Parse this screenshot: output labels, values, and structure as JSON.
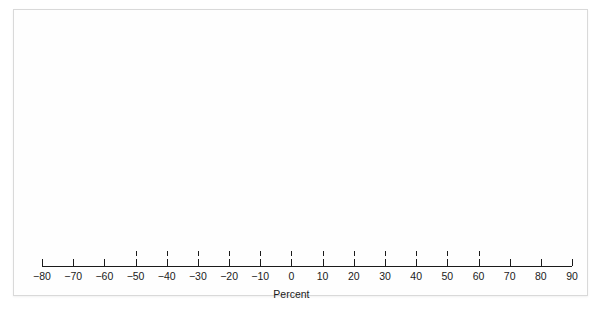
{
  "chart_data": {
    "type": "table",
    "title": "",
    "subtitle": "",
    "xlabel": "Percent",
    "ylabel": "",
    "xlim": [
      -85,
      95
    ],
    "xticks": [
      -80,
      -70,
      -60,
      -50,
      -40,
      -30,
      -20,
      -10,
      0,
      10,
      20,
      30,
      40,
      50,
      60,
      70,
      80,
      90
    ],
    "xticklabels": [
      "−80",
      "−70",
      "−60",
      "−50",
      "−40",
      "−30",
      "−20",
      "−10",
      "0",
      "10",
      "20",
      "30",
      "40",
      "50",
      "60",
      "70",
      "80",
      "90"
    ],
    "grid": false,
    "legend": null,
    "bin_width": 10,
    "bins": [
      {
        "bin_center": -45,
        "bin_range": [
          -50,
          -40
        ],
        "count": 1,
        "labels": [
          "1931"
        ]
      },
      {
        "bin_center": -35,
        "bin_range": [
          -40,
          -30
        ],
        "count": 1,
        "labels": [
          "1937"
        ]
      },
      {
        "bin_center": -25,
        "bin_range": [
          -30,
          -20
        ],
        "count": 3,
        "labels": [
          "2002",
          "1974",
          "1930"
        ]
      },
      {
        "bin_center": -15,
        "bin_range": [
          -20,
          -10
        ],
        "count": 5,
        "labels": [
          "2001",
          "1973",
          "1966",
          "1957",
          "1941"
        ]
      },
      {
        "bin_center": -5,
        "bin_range": [
          -10,
          0
        ],
        "count": 14,
        "labels": [
          "2000",
          "1990",
          "1981",
          "1977",
          "1969",
          "1962",
          "1953",
          "1946",
          "1940",
          "1939",
          "1934",
          "1932",
          "1929"
        ]
      },
      {
        "bin_center": 5,
        "bin_range": [
          0,
          10
        ],
        "count": 13,
        "labels": [
          "2007",
          "2005",
          "1994",
          "1993",
          "1992",
          "1987",
          "1984",
          "1978",
          "1970",
          "1960",
          "1956",
          "1948",
          "1947"
        ]
      },
      {
        "bin_center": 15,
        "bin_range": [
          10,
          20
        ],
        "count": 13,
        "labels": [
          "1988",
          "1986",
          "1979",
          "1972",
          "1971",
          "1968",
          "1965",
          "1964",
          "1959",
          "1952",
          "1949",
          "1944",
          "1926"
        ]
      },
      {
        "bin_center": 25,
        "bin_range": [
          20,
          30
        ],
        "count": 15,
        "labels": [
          "2006",
          "2004",
          "2003",
          "1999",
          "1998",
          "1996",
          "1983",
          "1982",
          "1976",
          "1967",
          "1963",
          "1961",
          "1951",
          "1943",
          "1942"
        ]
      },
      {
        "bin_center": 35,
        "bin_range": [
          30,
          40
        ],
        "count": 13,
        "labels": [
          "1997",
          "1995",
          "1991",
          "1989",
          "1985",
          "1980",
          "1975",
          "1955",
          "1950",
          "1945",
          "1938",
          "1936",
          "1927"
        ]
      },
      {
        "bin_center": 45,
        "bin_range": [
          40,
          50
        ],
        "count": 3,
        "labels": [
          "1958",
          "1935",
          "1928"
        ]
      },
      {
        "bin_center": 55,
        "bin_range": [
          50,
          60
        ],
        "count": 2,
        "labels": [
          "1954",
          "1933"
        ]
      }
    ]
  },
  "axis": {
    "title": "Percent",
    "ticks": [
      {
        "value": -80,
        "label": "−80"
      },
      {
        "value": -70,
        "label": "−70"
      },
      {
        "value": -60,
        "label": "−60"
      },
      {
        "value": -50,
        "label": "−50"
      },
      {
        "value": -40,
        "label": "−40"
      },
      {
        "value": -30,
        "label": "−30"
      },
      {
        "value": -20,
        "label": "−20"
      },
      {
        "value": -10,
        "label": "−10"
      },
      {
        "value": 0,
        "label": "0"
      },
      {
        "value": 10,
        "label": "10"
      },
      {
        "value": 20,
        "label": "20"
      },
      {
        "value": 30,
        "label": "30"
      },
      {
        "value": 40,
        "label": "40"
      },
      {
        "value": 50,
        "label": "50"
      },
      {
        "value": 60,
        "label": "60"
      },
      {
        "value": 70,
        "label": "70"
      },
      {
        "value": 80,
        "label": "80"
      },
      {
        "value": 90,
        "label": "90"
      }
    ]
  },
  "style": {
    "text_color": "#1b1b1b",
    "background": "#ffffff",
    "card_background": "#fefefe",
    "border_color": "#d9d9d9"
  }
}
